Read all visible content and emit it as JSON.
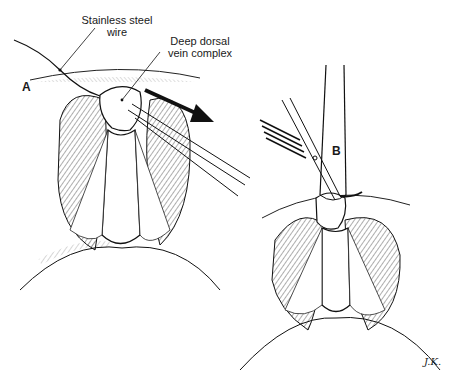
{
  "figure": {
    "panels": [
      {
        "id": "A",
        "label": "A"
      },
      {
        "id": "B",
        "label": "B"
      }
    ],
    "callouts": [
      {
        "line1": "Stainless steel",
        "line2": "wire"
      },
      {
        "line1": "Deep dorsal",
        "line2": "vein complex"
      }
    ],
    "signature": "J.K."
  }
}
